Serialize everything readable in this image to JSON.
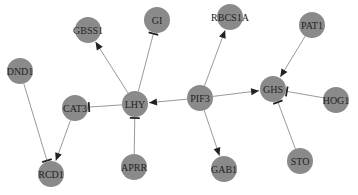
{
  "diagram": {
    "type": "gene-regulatory-network",
    "colors": {
      "node_fill": "#8a8a8a",
      "edge": "#9a9a9a",
      "arrow": "#222222",
      "label": "#222222",
      "background": "#ffffff"
    },
    "node_radius": 13,
    "nodes": [
      {
        "id": "GBSS1",
        "label": "GBSS1",
        "x": 88,
        "y": 30
      },
      {
        "id": "GI",
        "label": "GI",
        "x": 157,
        "y": 20
      },
      {
        "id": "RBCS1A",
        "label": "RBCS1A",
        "x": 230,
        "y": 17
      },
      {
        "id": "PAT1",
        "label": "PAT1",
        "x": 312,
        "y": 25
      },
      {
        "id": "DND1",
        "label": "DND1",
        "x": 20,
        "y": 71
      },
      {
        "id": "CAT3",
        "label": "CAT3",
        "x": 75,
        "y": 108
      },
      {
        "id": "LHY",
        "label": "LHY",
        "x": 135,
        "y": 104
      },
      {
        "id": "PIF3",
        "label": "PIF3",
        "x": 200,
        "y": 98
      },
      {
        "id": "GHS",
        "label": "GHS",
        "x": 273,
        "y": 89
      },
      {
        "id": "HOG1",
        "label": "HOG1",
        "x": 336,
        "y": 100
      },
      {
        "id": "RCD1",
        "label": "RCD1",
        "x": 51,
        "y": 174
      },
      {
        "id": "APRR",
        "label": "APRR",
        "x": 134,
        "y": 167
      },
      {
        "id": "GAB1",
        "label": "GAB1",
        "x": 224,
        "y": 169
      },
      {
        "id": "STO",
        "label": "STO",
        "x": 300,
        "y": 161
      }
    ],
    "edges": [
      {
        "from": "LHY",
        "to": "GBSS1",
        "type": "activation"
      },
      {
        "from": "LHY",
        "to": "GI",
        "type": "inhibition"
      },
      {
        "from": "PIF3",
        "to": "RBCS1A",
        "type": "activation"
      },
      {
        "from": "PIF3",
        "to": "LHY",
        "type": "activation"
      },
      {
        "from": "PIF3",
        "to": "GHS",
        "type": "activation"
      },
      {
        "from": "PIF3",
        "to": "GAB1",
        "type": "activation"
      },
      {
        "from": "PAT1",
        "to": "GHS",
        "type": "activation"
      },
      {
        "from": "HOG1",
        "to": "GHS",
        "type": "inhibition"
      },
      {
        "from": "STO",
        "to": "GHS",
        "type": "inhibition"
      },
      {
        "from": "LHY",
        "to": "CAT3",
        "type": "inhibition"
      },
      {
        "from": "APRR",
        "to": "LHY",
        "type": "inhibition"
      },
      {
        "from": "CAT3",
        "to": "RCD1",
        "type": "activation"
      },
      {
        "from": "DND1",
        "to": "RCD1",
        "type": "inhibition"
      }
    ]
  }
}
